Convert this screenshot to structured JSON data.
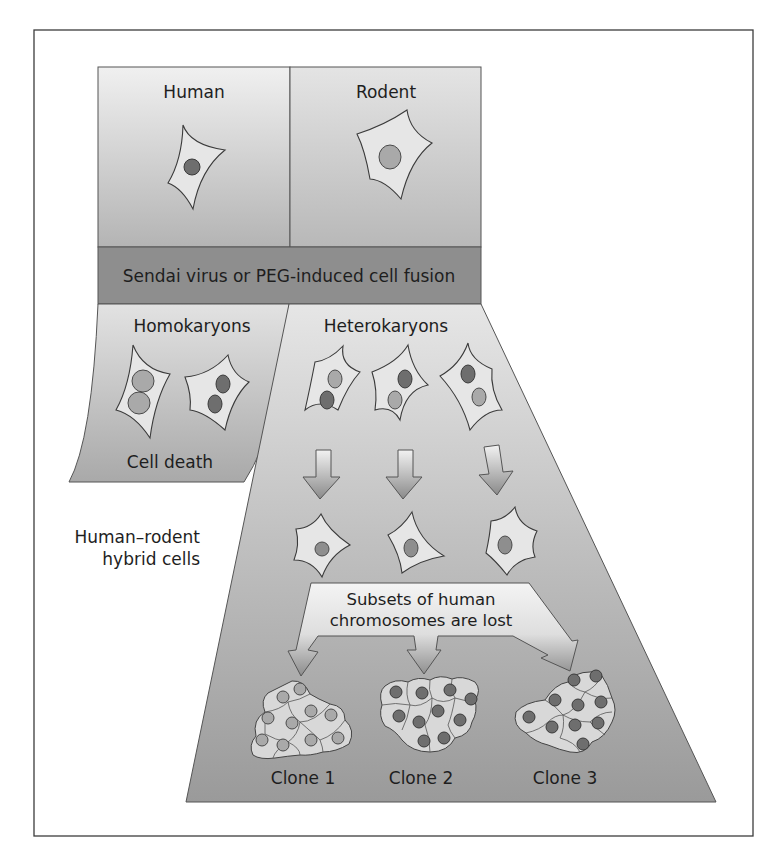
{
  "figure": {
    "colors": {
      "frame_border": "#3c3c3c",
      "panel_top_light": "#eeeeee",
      "panel_mid": "#c4c4c4",
      "fusion_band": "#8e8e8e",
      "trapezoid_top": "#e3e3e3",
      "trapezoid_bottom": "#9a9a9a",
      "nucleus_human": "#6e6e6e",
      "nucleus_rodent": "#a9a9a9",
      "cytoplasm": "#e6e6e6"
    }
  },
  "panels": {
    "human": {
      "label": "Human",
      "nucleus": "dark"
    },
    "rodent": {
      "label": "Rodent",
      "nucleus": "light"
    },
    "fusion": {
      "label": "Sendai virus or PEG-induced cell fusion"
    },
    "homokaryons": {
      "label": "Homokaryons",
      "outcome": "Cell death",
      "cells": [
        {
          "nuclei": [
            "light",
            "light"
          ]
        },
        {
          "nuclei": [
            "dark",
            "dark"
          ]
        }
      ]
    },
    "heterokaryons": {
      "label": "Heterokaryons",
      "cells": [
        {
          "nuclei": [
            "light",
            "dark"
          ]
        },
        {
          "nuclei": [
            "dark",
            "light"
          ]
        },
        {
          "nuclei": [
            "dark",
            "light"
          ]
        }
      ]
    },
    "hybrids": {
      "side_label_line1": "Human–rodent",
      "side_label_line2": "hybrid cells",
      "count": 3
    },
    "chromosome_loss": {
      "line1": "Subsets of human",
      "line2": "chromosomes are lost"
    },
    "clones": [
      {
        "label": "Clone 1",
        "nucleus": "light",
        "cell_count": 11
      },
      {
        "label": "Clone 2",
        "nucleus": "dark",
        "cell_count": 11
      },
      {
        "label": "Clone 3",
        "nucleus": "dark",
        "cell_count": 11
      }
    ]
  }
}
